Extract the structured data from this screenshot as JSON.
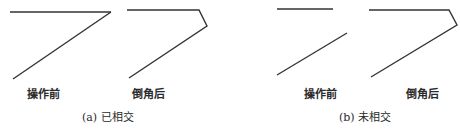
{
  "figure": {
    "panels": [
      {
        "id": "a",
        "caption": "(a) 已相交",
        "before_label": "操作前",
        "after_label": "倒角后",
        "before_lines": [
          {
            "x1": 10,
            "y1": 12,
            "x2": 111,
            "y2": 12
          },
          {
            "x1": 111,
            "y1": 12,
            "x2": 13,
            "y2": 79
          }
        ],
        "after_polyline": "127,10 199,10 207,26 129,78"
      },
      {
        "id": "b",
        "caption": "(b) 未相交",
        "before_label": "操作前",
        "after_label": "倒角后",
        "before_lines": [
          {
            "x1": 277,
            "y1": 9,
            "x2": 333,
            "y2": 9
          },
          {
            "x1": 347,
            "y1": 33,
            "x2": 277,
            "y2": 75
          }
        ],
        "after_polyline": "369,10 449,10 457,25 371,77"
      }
    ],
    "line_color": "#333333"
  }
}
